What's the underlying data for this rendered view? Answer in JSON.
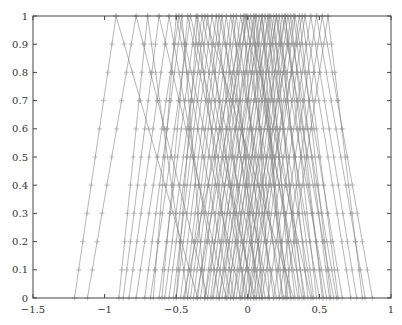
{
  "chart_data": {
    "type": "line",
    "title": "",
    "xlabel": "",
    "ylabel": "",
    "xlim": [
      -1.5,
      1
    ],
    "ylim": [
      0,
      1
    ],
    "grid": false,
    "legend": null,
    "x_ticks": [
      "-1.5",
      "-1",
      "-0.5",
      "0",
      "0.5",
      "1"
    ],
    "y_ticks": [
      "0",
      "0.1",
      "0.2",
      "0.3",
      "0.4",
      "0.5",
      "0.6",
      "0.7",
      "0.8",
      "0.9",
      "1"
    ],
    "marker": "+",
    "marker_y_levels": [
      0,
      0.1,
      0.2,
      0.3,
      0.4,
      0.5,
      0.6,
      0.7,
      0.8,
      0.9,
      1
    ],
    "line_color": "#7a7a7a",
    "series_format": "[left_foot, peak, right_foot]",
    "series": [
      [
        -1.21,
        -0.92,
        -0.35
      ],
      [
        -1.12,
        -0.78,
        -0.28
      ],
      [
        -0.9,
        -0.7,
        -0.42
      ],
      [
        -0.87,
        -0.62,
        -0.15
      ],
      [
        -0.83,
        -0.55,
        -0.2
      ],
      [
        -0.78,
        -0.48,
        -0.05
      ],
      [
        -0.72,
        -0.46,
        -0.3
      ],
      [
        -0.68,
        -0.4,
        0.05
      ],
      [
        -0.62,
        -0.36,
        -0.1
      ],
      [
        -0.58,
        -0.32,
        0.1
      ],
      [
        -0.52,
        -0.28,
        -0.02
      ],
      [
        -0.5,
        -0.25,
        0.15
      ],
      [
        -0.47,
        -0.22,
        0.02
      ],
      [
        -0.44,
        -0.2,
        0.2
      ],
      [
        -0.42,
        -0.18,
        0.08
      ],
      [
        -0.4,
        -0.15,
        0.12
      ],
      [
        -0.38,
        -0.12,
        0.25
      ],
      [
        -0.35,
        -0.1,
        0.06
      ],
      [
        -0.33,
        -0.08,
        0.18
      ],
      [
        -0.3,
        -0.05,
        0.3
      ],
      [
        -0.28,
        -0.03,
        0.1
      ],
      [
        -0.26,
        -0.01,
        0.22
      ],
      [
        -0.24,
        0.02,
        0.35
      ],
      [
        -0.22,
        0.04,
        0.15
      ],
      [
        -0.2,
        0.06,
        0.28
      ],
      [
        -0.18,
        0.08,
        0.4
      ],
      [
        -0.16,
        0.1,
        0.24
      ],
      [
        -0.14,
        0.12,
        0.45
      ],
      [
        -0.12,
        0.14,
        0.3
      ],
      [
        -0.1,
        0.16,
        0.5
      ],
      [
        -0.08,
        0.18,
        0.36
      ],
      [
        -0.06,
        0.2,
        0.55
      ],
      [
        -0.04,
        0.22,
        0.42
      ],
      [
        -0.02,
        0.24,
        0.6
      ],
      [
        0.0,
        0.26,
        0.48
      ],
      [
        0.02,
        0.28,
        0.62
      ],
      [
        0.04,
        0.3,
        0.52
      ],
      [
        0.06,
        0.33,
        0.66
      ],
      [
        0.08,
        0.36,
        0.58
      ],
      [
        0.1,
        0.4,
        0.72
      ],
      [
        0.14,
        0.44,
        0.76
      ],
      [
        0.18,
        0.48,
        0.82
      ],
      [
        0.22,
        0.52,
        0.87
      ],
      [
        0.26,
        0.56,
        0.8
      ],
      [
        -0.55,
        -0.3,
        0.32
      ],
      [
        -0.45,
        -0.02,
        0.38
      ],
      [
        -0.36,
        0.0,
        0.44
      ],
      [
        -0.3,
        0.05,
        0.27
      ],
      [
        -0.25,
        0.1,
        0.33
      ],
      [
        -0.2,
        0.15,
        0.39
      ],
      [
        -0.15,
        0.2,
        0.46
      ],
      [
        -0.1,
        0.26,
        0.53
      ],
      [
        -0.05,
        0.32,
        0.57
      ],
      [
        0.0,
        0.38,
        0.63
      ],
      [
        -0.6,
        -0.42,
        0.0
      ],
      [
        -0.66,
        -0.5,
        -0.12
      ],
      [
        -0.5,
        -0.35,
        0.04
      ]
    ]
  }
}
